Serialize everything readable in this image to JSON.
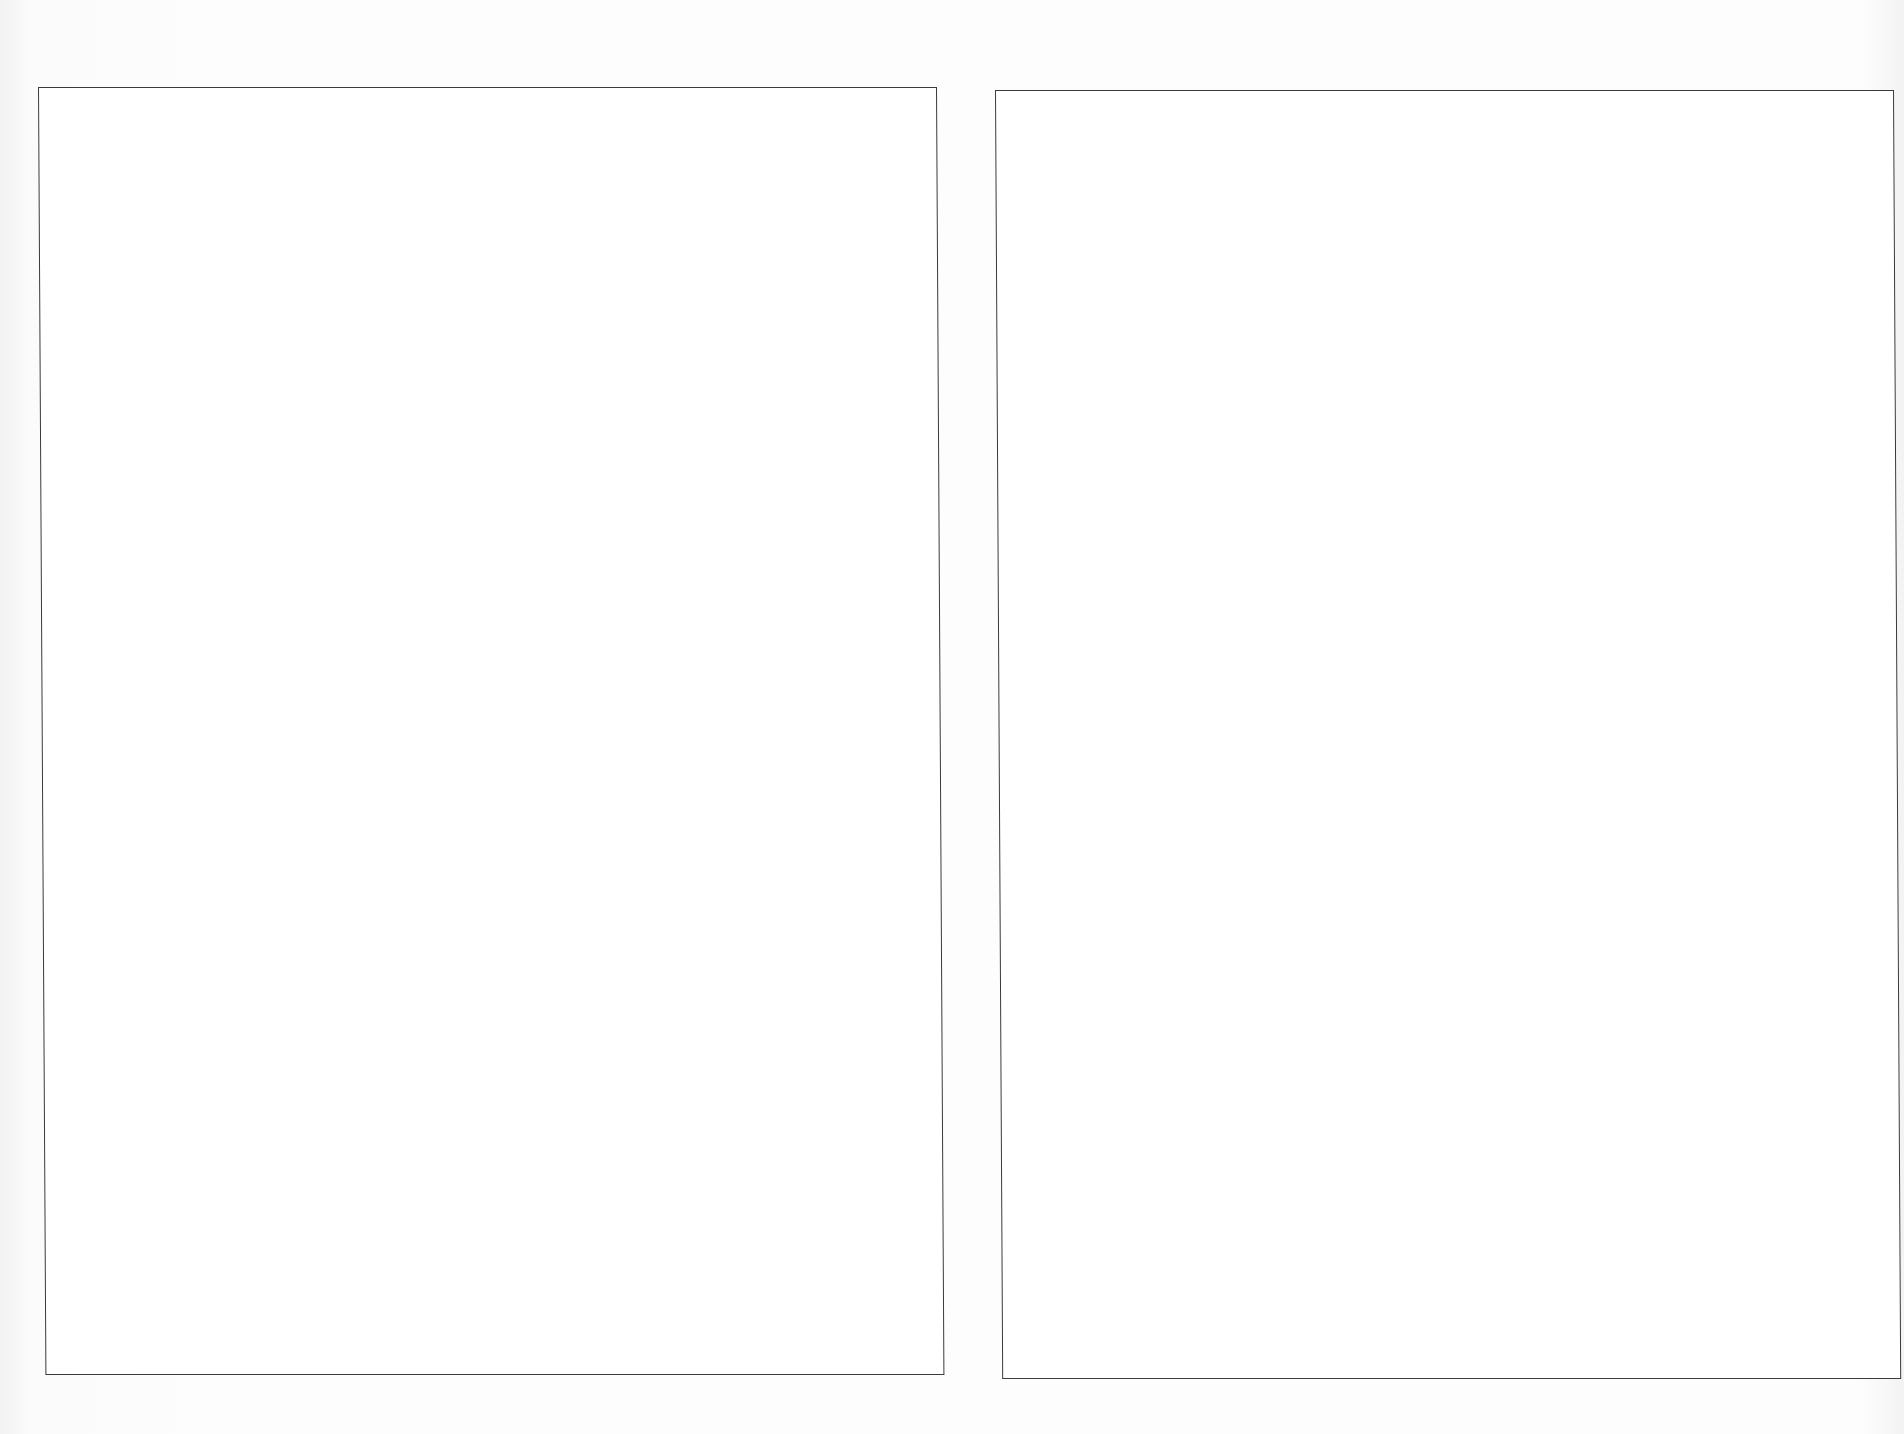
{
  "document": {
    "running_header": "",
    "frames": [
      {
        "id": "left",
        "content": ""
      },
      {
        "id": "right",
        "content": ""
      }
    ]
  }
}
